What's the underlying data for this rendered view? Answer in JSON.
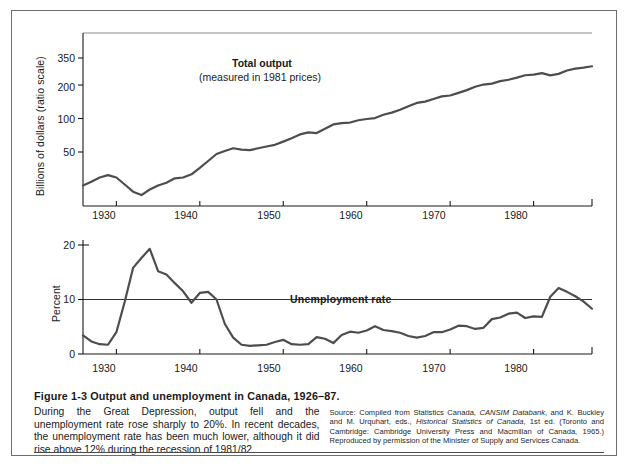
{
  "figure": {
    "caption_title": "Figure 1-3   Output and unemployment in Canada, 1926–87.",
    "caption_text": "During the Great Depression, output fell and the unemployment rate rose sharply to 20%. In recent decades, the unemployment rate has been much lower, although it did rise above 12% during the recession of 1981/82.",
    "source_prefix": "Source: Compiled from Statistics Canada, ",
    "source_italic1": "CANSIM Databank",
    "source_mid1": ", and K. Buckley and M. Urquhart, eds., ",
    "source_italic2": "Historical Statistics of Canada",
    "source_mid2": ", 1st ed. (Toronto and Cambridge: Cambridge University Press and Macmillan of Canada, 1965.) Reproduced by permission of the Minister of Supply and Services Canada."
  },
  "colors": {
    "line": "#4d4d4d",
    "axis": "#1a1a1a",
    "grid": "#8c8c8c",
    "frame": "#6e6e6e",
    "text": "#1a1a1a"
  },
  "chart_data": [
    {
      "type": "line",
      "id": "total-output",
      "title": "Total output",
      "subtitle": "(measured in 1981 prices)",
      "xlabel": "",
      "ylabel": "Billions of dollars (ratio scale)",
      "scale": "log",
      "ylim": [
        18,
        420
      ],
      "xlim": [
        1926,
        1987
      ],
      "yticks": [
        50,
        100,
        200,
        350
      ],
      "ytick_labels": [
        "50",
        "100",
        "200",
        "350"
      ],
      "xticks": [
        1930,
        1940,
        1950,
        1960,
        1970,
        1980
      ],
      "xtick_labels": [
        "1930",
        "1940",
        "1950",
        "1960",
        "1970",
        "1980"
      ],
      "grid": "top-rule-only",
      "legend": "inline-annotation",
      "x": [
        1926,
        1927,
        1928,
        1929,
        1930,
        1931,
        1932,
        1933,
        1934,
        1935,
        1936,
        1937,
        1938,
        1939,
        1940,
        1941,
        1942,
        1943,
        1944,
        1945,
        1946,
        1947,
        1948,
        1949,
        1950,
        1951,
        1952,
        1953,
        1954,
        1955,
        1956,
        1957,
        1958,
        1959,
        1960,
        1961,
        1962,
        1963,
        1964,
        1965,
        1966,
        1967,
        1968,
        1969,
        1970,
        1971,
        1972,
        1973,
        1974,
        1975,
        1976,
        1977,
        1978,
        1979,
        1980,
        1981,
        1982,
        1983,
        1984,
        1985,
        1986,
        1987
      ],
      "values": [
        25.0,
        27.0,
        29.5,
        31.0,
        29.5,
        25.5,
        22.0,
        20.5,
        23.0,
        25.0,
        26.5,
        29.0,
        29.5,
        31.5,
        36.0,
        41.5,
        48.0,
        51.0,
        54.0,
        52.5,
        52.0,
        54.0,
        56.0,
        58.0,
        62.0,
        66.5,
        72.0,
        75.0,
        74.0,
        81.0,
        88.5,
        91.0,
        92.0,
        96.5,
        99.0,
        101.0,
        108.0,
        113.0,
        120.0,
        129.0,
        138.0,
        142.0,
        150.0,
        158.0,
        161.0,
        170.0,
        180.0,
        193.0,
        202.0,
        206.0,
        217.0,
        223.0,
        233.0,
        245.0,
        248.0,
        256.0,
        244.0,
        252.0,
        270.0,
        281.0,
        287.0,
        295.0
      ]
    },
    {
      "type": "line",
      "id": "unemployment-rate",
      "title": "Unemployment rate",
      "subtitle": "",
      "xlabel": "",
      "ylabel": "Percent",
      "scale": "linear",
      "ylim": [
        0,
        21
      ],
      "xlim": [
        1926,
        1987
      ],
      "yticks": [
        0,
        10,
        20
      ],
      "ytick_labels": [
        "0",
        "10",
        "20"
      ],
      "xticks": [
        1930,
        1940,
        1950,
        1960,
        1970,
        1980
      ],
      "xtick_labels": [
        "1930",
        "1940",
        "1950",
        "1960",
        "1970",
        "1980"
      ],
      "gridlines": [
        10
      ],
      "grid": "single-hline-at-10",
      "x": [
        1926,
        1927,
        1928,
        1929,
        1930,
        1931,
        1932,
        1933,
        1934,
        1935,
        1936,
        1937,
        1938,
        1939,
        1940,
        1941,
        1942,
        1943,
        1944,
        1945,
        1946,
        1947,
        1948,
        1949,
        1950,
        1951,
        1952,
        1953,
        1954,
        1955,
        1956,
        1957,
        1958,
        1959,
        1960,
        1961,
        1962,
        1963,
        1964,
        1965,
        1966,
        1967,
        1968,
        1969,
        1970,
        1971,
        1972,
        1973,
        1974,
        1975,
        1976,
        1977,
        1978,
        1979,
        1980,
        1981,
        1982,
        1983,
        1984,
        1985,
        1986,
        1987
      ],
      "values": [
        3.4,
        2.3,
        1.8,
        1.7,
        4.0,
        9.6,
        15.8,
        17.6,
        19.3,
        15.2,
        14.6,
        13.0,
        11.5,
        9.4,
        11.2,
        11.4,
        10.0,
        5.5,
        3.0,
        1.7,
        1.5,
        1.6,
        1.7,
        2.2,
        2.6,
        1.8,
        1.7,
        1.8,
        3.1,
        2.8,
        2.0,
        3.5,
        4.1,
        3.9,
        4.3,
        5.1,
        4.4,
        4.2,
        3.9,
        3.3,
        3.0,
        3.3,
        4.0,
        4.0,
        4.5,
        5.2,
        5.1,
        4.6,
        4.8,
        6.4,
        6.7,
        7.4,
        7.6,
        6.6,
        6.9,
        6.8,
        10.5,
        12.1,
        11.4,
        10.6,
        9.6,
        8.3
      ]
    }
  ]
}
